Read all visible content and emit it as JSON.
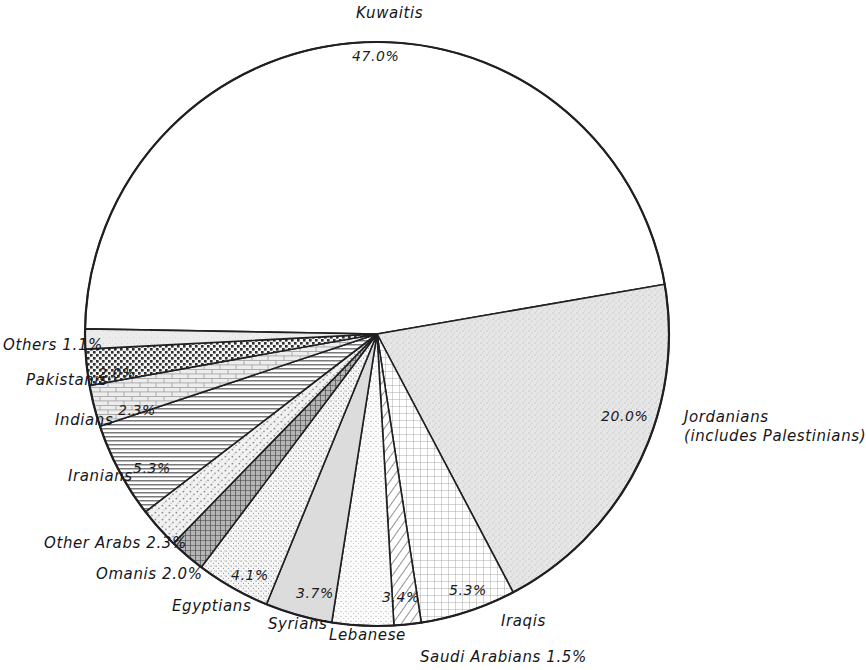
{
  "chart_data": {
    "type": "pie",
    "title": "",
    "subtitle": "",
    "xlabel": "",
    "ylabel": "",
    "legend_position": "none",
    "grid": false,
    "units": "percent",
    "total": 100.0,
    "start_angle_deg": 181.0,
    "direction": "clockwise",
    "categories": [
      "Kuwaitis",
      "Jordanians (includes Palestinians)",
      "Iraqis",
      "Saudi Arabians",
      "Lebanese",
      "Syrians",
      "Egyptians",
      "Omanis",
      "Other Arabs",
      "Iranians",
      "Indians",
      "Pakistanis",
      "Others"
    ],
    "values": [
      47.0,
      20.0,
      5.3,
      1.5,
      3.4,
      3.7,
      4.1,
      2.0,
      2.3,
      5.3,
      2.3,
      2.0,
      1.1
    ],
    "slices": [
      {
        "name": "Kuwaitis",
        "value": 47.0,
        "value_label": "47.0%",
        "fill": "blank",
        "label_placement": "outside-top"
      },
      {
        "name": "Jordanians",
        "value": 20.0,
        "value_label": "20.0%",
        "fill": "stipple-gray",
        "label_placement": "outside-right",
        "note": "(includes Palestinians)"
      },
      {
        "name": "Iraqis",
        "value": 5.3,
        "value_label": "5.3%",
        "fill": "fine-grid",
        "label_placement": "outside-bottom-right"
      },
      {
        "name": "Saudi Arabians",
        "value": 1.5,
        "value_label": "1.5%",
        "fill": "diagonal-hatch",
        "label_placement": "outside-bottom-right"
      },
      {
        "name": "Lebanese",
        "value": 3.4,
        "value_label": "3.4%",
        "fill": "fine-stipple",
        "label_placement": "outside-bottom"
      },
      {
        "name": "Syrians",
        "value": 3.7,
        "value_label": "3.7%",
        "fill": "solid-gray",
        "label_placement": "outside-bottom"
      },
      {
        "name": "Egyptians",
        "value": 4.1,
        "value_label": "4.1%",
        "fill": "medium-stipple",
        "label_placement": "outside-bottom-left"
      },
      {
        "name": "Omanis",
        "value": 2.0,
        "value_label": "2.0%",
        "fill": "dark-crosshatch",
        "label_placement": "outside-left"
      },
      {
        "name": "Other Arabs",
        "value": 2.3,
        "value_label": "2.3%",
        "fill": "coarse-stipple",
        "label_placement": "outside-left"
      },
      {
        "name": "Iranians",
        "value": 5.3,
        "value_label": "5.3%",
        "fill": "horizontal-lines",
        "label_placement": "outside-left"
      },
      {
        "name": "Indians",
        "value": 2.3,
        "value_label": "2.3%",
        "fill": "brick",
        "label_placement": "outside-left"
      },
      {
        "name": "Pakistanis",
        "value": 2.0,
        "value_label": "2.0%",
        "fill": "checker-dots",
        "label_placement": "outside-left"
      },
      {
        "name": "Others",
        "value": 1.1,
        "value_label": "1.1%",
        "fill": "light-stipple",
        "label_placement": "outside-left"
      }
    ]
  },
  "labels": {
    "kuwaitis_name": "Kuwaitis",
    "kuwaitis_pct": "47.0%",
    "jordanians_pct": "20.0%",
    "jordanians_name_line1": "Jordanians",
    "jordanians_name_line2": "(includes Palestinians)",
    "iraqis_pct": "5.3%",
    "iraqis_name": "Iraqis",
    "saudi_name_pct": "Saudi Arabians 1.5%",
    "lebanese_pct": "3.4%",
    "lebanese_name": "Lebanese",
    "syrians_pct": "3.7%",
    "syrians_name": "Syrians",
    "egyptians_pct": "4.1%",
    "egyptians_name": "Egyptians",
    "omanis_name_pct": "Omanis 2.0%",
    "other_arabs_name_pct": "Other Arabs 2.3%",
    "iranians_pct": "5.3%",
    "iranians_name": "Iranians",
    "indians_pct": "2.3%",
    "indians_name": "Indians",
    "pakistanis_pct": "2.0%",
    "pakistanis_name": "Pakistanis",
    "others_name_pct": "Others 1.1%"
  },
  "colors": {
    "outline": "#202024",
    "background": "#ffffff",
    "gray_light": "#e3e3e3",
    "gray_mid": "#c9c9c9",
    "ink": "#16161a"
  }
}
